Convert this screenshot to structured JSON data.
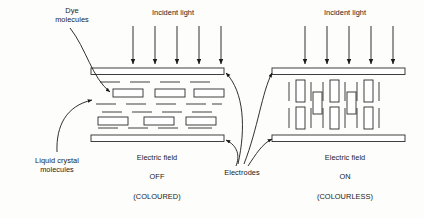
{
  "diagram": {
    "labels": {
      "dye_molecules": "Dye\nmolecules",
      "incident_light_left": "Incident light",
      "incident_light_right": "Incident light",
      "liquid_crystal_molecules": "Liquid crystal\nmolecules",
      "electrodes": "Electrodes",
      "electric_field_left": "Electric field",
      "state_left": "OFF",
      "appearance_left": "(COLOURED)",
      "electric_field_right": "Electric field",
      "state_right": "ON",
      "appearance_right": "(COLOURLESS)"
    },
    "colors": {
      "ink": "#1a1a1a",
      "stroke": "#2b2b2b",
      "background": "#fdfdfb",
      "shape_fill": "#ffffff"
    },
    "panels": [
      {
        "name": "field-off-panel",
        "state": "OFF",
        "appearance": "COLOURED",
        "orientation": "horizontal",
        "incident_light_arrows": 5,
        "electrodes": 2,
        "dye_molecule_count": 6,
        "liquid_crystal_line_rows": 4
      },
      {
        "name": "field-on-panel",
        "state": "ON",
        "appearance": "COLOURLESS",
        "orientation": "vertical",
        "incident_light_arrows": 5,
        "electrodes": 2,
        "dye_molecule_count": 6,
        "liquid_crystal_line_count": 12
      }
    ]
  }
}
